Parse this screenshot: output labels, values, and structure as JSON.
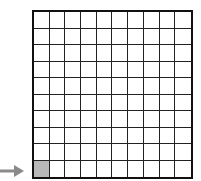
{
  "diagram": {
    "type": "grid",
    "rows": 10,
    "columns": 10,
    "total_cells": 100,
    "shaded_cells": [
      {
        "row": 10,
        "column": 1
      }
    ],
    "shaded_count": 1,
    "colors": {
      "grid_line": "#222222",
      "shaded": "#b8b8b8",
      "background": "#ffffff",
      "arrow": "#8a8a8a"
    },
    "arrow": {
      "direction": "right",
      "points_to": "row 10, column 1 (bottom-left cell)",
      "icon": "arrow-right-icon"
    }
  }
}
